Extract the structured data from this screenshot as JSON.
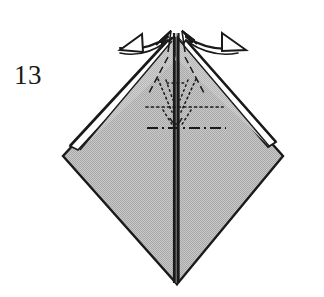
{
  "figure": {
    "kind": "origami-folding-diagram",
    "step_number": "13",
    "colors": {
      "paper_fill": "#b9b9b9",
      "paper_fill_light": "#c6c6c6",
      "outline": "#1a1a1a",
      "crease_line": "#1a1a1a",
      "background": "#ffffff",
      "highlight_white": "#ffffff"
    }
  },
  "geometry": {
    "diamond": {
      "top_apex": {
        "x": 172,
        "y": 36
      },
      "left_vertex": {
        "x": 63,
        "y": 156
      },
      "right_vertex": {
        "x": 283,
        "y": 156
      },
      "bottom_apex": {
        "x": 177,
        "y": 283
      }
    },
    "center_line": {
      "x": 175,
      "y_top": 33,
      "y_bottom": 283
    }
  },
  "annotations": {
    "arrow_left": {
      "name": "fold-arrow-left",
      "label": "",
      "direction": "outward-left",
      "style": "hollow-arrowhead-curved"
    },
    "arrow_right": {
      "name": "fold-arrow-right",
      "label": "",
      "direction": "outward-right",
      "style": "hollow-arrowhead-curved"
    },
    "creases": [
      {
        "name": "hidden-valley-v-left",
        "style": "dotted"
      },
      {
        "name": "hidden-valley-v-right",
        "style": "dotted"
      },
      {
        "name": "hidden-horizontal-crease",
        "style": "dotted"
      },
      {
        "name": "mountain-fold-line",
        "style": "dash-dot"
      },
      {
        "name": "center-vertical-crease",
        "style": "solid"
      },
      {
        "name": "diagonal-crease-left",
        "style": "dashed"
      },
      {
        "name": "diagonal-crease-right",
        "style": "dashed"
      }
    ]
  }
}
